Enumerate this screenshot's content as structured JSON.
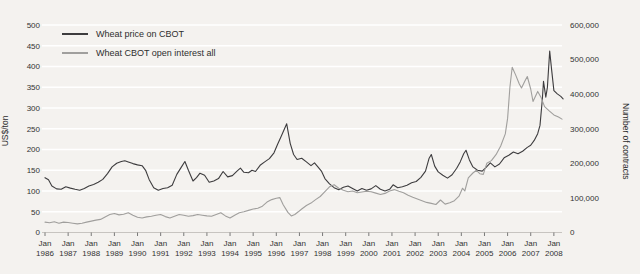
{
  "colors": {
    "background": "#f4f2ef",
    "grid": "#ffffff",
    "axis_line": "#c7c4c0",
    "tick": "#6b6b6b",
    "text": "#333333",
    "price_line": "#3d3c3e",
    "open_interest_line": "#a09f9d"
  },
  "chart_data": {
    "type": "line",
    "title": "",
    "grid": "horizontal white gridlines",
    "legend_position": "top-left inside plot",
    "legend": [
      {
        "id": "price-line",
        "label": "Wheat price on CBOT",
        "color": "#3d3c3e",
        "axis": "left"
      },
      {
        "id": "open-interest-line",
        "label": "Wheat CBOT open interest all",
        "color": "#a09f9d",
        "axis": "right"
      }
    ],
    "x_axis": {
      "tick_month": "Jan",
      "tick_years": [
        "1986",
        "1987",
        "1988",
        "1989",
        "1990",
        "1991",
        "1992",
        "1993",
        "1994",
        "1995",
        "1996",
        "1997",
        "1998",
        "1999",
        "2000",
        "2001",
        "2002",
        "2003",
        "2004",
        "2005",
        "2006",
        "2007",
        "2008"
      ],
      "range": [
        1986.0,
        2008.4
      ]
    },
    "y_left": {
      "label": "US$/ton",
      "range": [
        0,
        500
      ],
      "tick_values": [
        0,
        50,
        100,
        150,
        200,
        250,
        300,
        350,
        400,
        450,
        500
      ],
      "ticks": [
        "0",
        "50",
        "100",
        "150",
        "200",
        "250",
        "300",
        "350",
        "400",
        "450",
        "500"
      ]
    },
    "y_right": {
      "label": "Number of contracts",
      "range": [
        0,
        600000
      ],
      "tick_values": [
        0,
        100000,
        200000,
        300000,
        400000,
        500000,
        600000
      ],
      "ticks": [
        "0",
        "100,000",
        "200,000",
        "300,000",
        "400,000",
        "500,000",
        "600,000"
      ]
    },
    "series": [
      {
        "id": "price-line",
        "name": "Wheat price on CBOT",
        "axis": "left",
        "unit": "US$/ton",
        "color": "#3d3c3e",
        "points": [
          [
            1986.0,
            132
          ],
          [
            1986.15,
            127
          ],
          [
            1986.3,
            112
          ],
          [
            1986.5,
            105
          ],
          [
            1986.7,
            104
          ],
          [
            1986.9,
            110
          ],
          [
            1987.1,
            107
          ],
          [
            1987.3,
            104
          ],
          [
            1987.5,
            102
          ],
          [
            1987.7,
            106
          ],
          [
            1987.9,
            112
          ],
          [
            1988.1,
            116
          ],
          [
            1988.3,
            121
          ],
          [
            1988.5,
            128
          ],
          [
            1988.7,
            142
          ],
          [
            1988.9,
            158
          ],
          [
            1989.1,
            167
          ],
          [
            1989.3,
            171
          ],
          [
            1989.45,
            173
          ],
          [
            1989.6,
            170
          ],
          [
            1989.8,
            166
          ],
          [
            1990.0,
            163
          ],
          [
            1990.2,
            161
          ],
          [
            1990.35,
            150
          ],
          [
            1990.5,
            128
          ],
          [
            1990.7,
            108
          ],
          [
            1990.9,
            102
          ],
          [
            1991.1,
            106
          ],
          [
            1991.3,
            108
          ],
          [
            1991.5,
            114
          ],
          [
            1991.7,
            140
          ],
          [
            1991.9,
            158
          ],
          [
            1992.05,
            171
          ],
          [
            1992.2,
            150
          ],
          [
            1992.4,
            124
          ],
          [
            1992.55,
            132
          ],
          [
            1992.7,
            143
          ],
          [
            1992.9,
            138
          ],
          [
            1993.1,
            121
          ],
          [
            1993.3,
            124
          ],
          [
            1993.5,
            130
          ],
          [
            1993.7,
            147
          ],
          [
            1993.9,
            134
          ],
          [
            1994.1,
            137
          ],
          [
            1994.3,
            148
          ],
          [
            1994.45,
            155
          ],
          [
            1994.6,
            145
          ],
          [
            1994.8,
            144
          ],
          [
            1994.95,
            150
          ],
          [
            1995.1,
            147
          ],
          [
            1995.3,
            162
          ],
          [
            1995.5,
            170
          ],
          [
            1995.7,
            178
          ],
          [
            1995.9,
            192
          ],
          [
            1996.05,
            212
          ],
          [
            1996.2,
            230
          ],
          [
            1996.45,
            262
          ],
          [
            1996.6,
            215
          ],
          [
            1996.75,
            188
          ],
          [
            1996.9,
            176
          ],
          [
            1997.1,
            179
          ],
          [
            1997.3,
            170
          ],
          [
            1997.5,
            161
          ],
          [
            1997.65,
            168
          ],
          [
            1997.8,
            158
          ],
          [
            1997.95,
            148
          ],
          [
            1998.1,
            130
          ],
          [
            1998.3,
            117
          ],
          [
            1998.5,
            108
          ],
          [
            1998.7,
            103
          ],
          [
            1998.9,
            109
          ],
          [
            1999.1,
            112
          ],
          [
            1999.3,
            106
          ],
          [
            1999.5,
            100
          ],
          [
            1999.7,
            106
          ],
          [
            1999.9,
            102
          ],
          [
            2000.1,
            105
          ],
          [
            2000.3,
            113
          ],
          [
            2000.5,
            104
          ],
          [
            2000.7,
            100
          ],
          [
            2000.9,
            104
          ],
          [
            2001.05,
            115
          ],
          [
            2001.25,
            108
          ],
          [
            2001.45,
            110
          ],
          [
            2001.65,
            114
          ],
          [
            2001.85,
            120
          ],
          [
            2002.05,
            123
          ],
          [
            2002.25,
            133
          ],
          [
            2002.45,
            148
          ],
          [
            2002.6,
            178
          ],
          [
            2002.7,
            188
          ],
          [
            2002.85,
            160
          ],
          [
            2003.0,
            146
          ],
          [
            2003.2,
            138
          ],
          [
            2003.4,
            131
          ],
          [
            2003.6,
            139
          ],
          [
            2003.8,
            155
          ],
          [
            2003.95,
            170
          ],
          [
            2004.1,
            190
          ],
          [
            2004.2,
            198
          ],
          [
            2004.35,
            175
          ],
          [
            2004.5,
            158
          ],
          [
            2004.7,
            150
          ],
          [
            2004.9,
            148
          ],
          [
            2005.05,
            156
          ],
          [
            2005.25,
            168
          ],
          [
            2005.45,
            158
          ],
          [
            2005.65,
            165
          ],
          [
            2005.85,
            180
          ],
          [
            2006.05,
            186
          ],
          [
            2006.25,
            194
          ],
          [
            2006.45,
            190
          ],
          [
            2006.65,
            196
          ],
          [
            2006.85,
            205
          ],
          [
            2007.0,
            210
          ],
          [
            2007.15,
            222
          ],
          [
            2007.3,
            238
          ],
          [
            2007.4,
            258
          ],
          [
            2007.5,
            320
          ],
          [
            2007.55,
            364
          ],
          [
            2007.65,
            326
          ],
          [
            2007.72,
            350
          ],
          [
            2007.82,
            437
          ],
          [
            2007.9,
            395
          ],
          [
            2008.0,
            342
          ],
          [
            2008.15,
            334
          ],
          [
            2008.3,
            328
          ],
          [
            2008.4,
            322
          ]
        ]
      },
      {
        "id": "open-interest-line",
        "name": "Wheat CBOT open interest all",
        "axis": "right",
        "unit": "contracts",
        "color": "#a09f9d",
        "points": [
          [
            1986.0,
            30000
          ],
          [
            1986.2,
            28000
          ],
          [
            1986.4,
            31000
          ],
          [
            1986.6,
            27000
          ],
          [
            1986.8,
            30000
          ],
          [
            1987.0,
            29000
          ],
          [
            1987.2,
            27000
          ],
          [
            1987.4,
            25000
          ],
          [
            1987.6,
            27000
          ],
          [
            1987.8,
            30000
          ],
          [
            1988.0,
            33000
          ],
          [
            1988.2,
            36000
          ],
          [
            1988.4,
            38000
          ],
          [
            1988.6,
            45000
          ],
          [
            1988.8,
            52000
          ],
          [
            1989.0,
            55000
          ],
          [
            1989.2,
            51000
          ],
          [
            1989.4,
            53000
          ],
          [
            1989.6,
            57000
          ],
          [
            1989.8,
            50000
          ],
          [
            1990.0,
            44000
          ],
          [
            1990.2,
            42000
          ],
          [
            1990.4,
            45000
          ],
          [
            1990.6,
            47000
          ],
          [
            1990.8,
            50000
          ],
          [
            1991.0,
            52000
          ],
          [
            1991.2,
            46000
          ],
          [
            1991.4,
            42000
          ],
          [
            1991.6,
            47000
          ],
          [
            1991.8,
            52000
          ],
          [
            1992.0,
            50000
          ],
          [
            1992.2,
            47000
          ],
          [
            1992.4,
            49000
          ],
          [
            1992.6,
            52000
          ],
          [
            1992.8,
            50000
          ],
          [
            1993.0,
            48000
          ],
          [
            1993.2,
            47000
          ],
          [
            1993.4,
            52000
          ],
          [
            1993.6,
            57000
          ],
          [
            1993.8,
            48000
          ],
          [
            1994.0,
            42000
          ],
          [
            1994.2,
            50000
          ],
          [
            1994.4,
            57000
          ],
          [
            1994.6,
            60000
          ],
          [
            1994.8,
            64000
          ],
          [
            1995.0,
            68000
          ],
          [
            1995.2,
            70000
          ],
          [
            1995.4,
            76000
          ],
          [
            1995.6,
            88000
          ],
          [
            1995.8,
            95000
          ],
          [
            1996.0,
            99000
          ],
          [
            1996.15,
            101000
          ],
          [
            1996.3,
            80000
          ],
          [
            1996.5,
            58000
          ],
          [
            1996.65,
            48000
          ],
          [
            1996.8,
            52000
          ],
          [
            1996.95,
            60000
          ],
          [
            1997.1,
            68000
          ],
          [
            1997.3,
            78000
          ],
          [
            1997.5,
            85000
          ],
          [
            1997.7,
            95000
          ],
          [
            1997.9,
            104000
          ],
          [
            1998.1,
            118000
          ],
          [
            1998.3,
            132000
          ],
          [
            1998.5,
            138000
          ],
          [
            1998.7,
            128000
          ],
          [
            1998.9,
            122000
          ],
          [
            1999.1,
            118000
          ],
          [
            1999.3,
            120000
          ],
          [
            1999.5,
            115000
          ],
          [
            1999.7,
            117000
          ],
          [
            1999.9,
            119000
          ],
          [
            2000.1,
            118000
          ],
          [
            2000.3,
            114000
          ],
          [
            2000.5,
            110000
          ],
          [
            2000.7,
            113000
          ],
          [
            2000.9,
            120000
          ],
          [
            2001.1,
            124000
          ],
          [
            2001.3,
            119000
          ],
          [
            2001.5,
            115000
          ],
          [
            2001.7,
            108000
          ],
          [
            2001.9,
            102000
          ],
          [
            2002.1,
            97000
          ],
          [
            2002.3,
            92000
          ],
          [
            2002.5,
            87000
          ],
          [
            2002.7,
            84000
          ],
          [
            2002.9,
            81000
          ],
          [
            2003.1,
            94000
          ],
          [
            2003.3,
            82000
          ],
          [
            2003.5,
            86000
          ],
          [
            2003.7,
            92000
          ],
          [
            2003.9,
            105000
          ],
          [
            2004.05,
            128000
          ],
          [
            2004.15,
            120000
          ],
          [
            2004.3,
            158000
          ],
          [
            2004.5,
            172000
          ],
          [
            2004.65,
            180000
          ],
          [
            2004.8,
            170000
          ],
          [
            2004.95,
            168000
          ],
          [
            2005.1,
            200000
          ],
          [
            2005.3,
            208000
          ],
          [
            2005.5,
            225000
          ],
          [
            2005.7,
            250000
          ],
          [
            2005.9,
            285000
          ],
          [
            2006.0,
            330000
          ],
          [
            2006.1,
            420000
          ],
          [
            2006.2,
            478000
          ],
          [
            2006.35,
            455000
          ],
          [
            2006.5,
            430000
          ],
          [
            2006.6,
            418000
          ],
          [
            2006.75,
            438000
          ],
          [
            2006.85,
            451000
          ],
          [
            2007.0,
            415000
          ],
          [
            2007.1,
            379000
          ],
          [
            2007.3,
            408000
          ],
          [
            2007.45,
            390000
          ],
          [
            2007.6,
            364000
          ],
          [
            2007.8,
            352000
          ],
          [
            2008.0,
            340000
          ],
          [
            2008.2,
            334000
          ],
          [
            2008.35,
            328000
          ]
        ]
      }
    ]
  }
}
